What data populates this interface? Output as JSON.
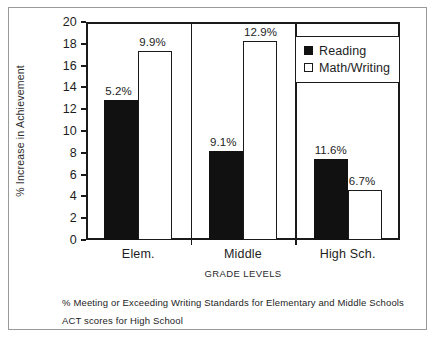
{
  "chart_data": {
    "type": "bar",
    "title": "",
    "xlabel": "GRADE LEVELS",
    "ylabel": "% Increase in Achievement",
    "categories": [
      "Elem.",
      "Middle",
      "High Sch."
    ],
    "ylim": [
      0,
      20
    ],
    "ytick_step": 2,
    "yticks": [
      20,
      18,
      16,
      14,
      12,
      10,
      8,
      6,
      4,
      2,
      0
    ],
    "grid": false,
    "legend_position": "top-right",
    "series": [
      {
        "name": "Reading",
        "style": "filled",
        "color": "#111111",
        "values": [
          12.8,
          8.2,
          7.4
        ],
        "labels": [
          "5.2%",
          "9.1%",
          "11.6%"
        ]
      },
      {
        "name": "Math/Writing",
        "style": "hollow",
        "color": "#ffffff",
        "values": [
          17.3,
          18.3,
          4.6
        ],
        "labels": [
          "9.9%",
          "12.9%",
          "6.7%"
        ]
      }
    ],
    "annotations": [
      "% Meeting or Exceeding Writing Standards for Elementary and Middle Schools",
      "ACT scores for High School"
    ]
  },
  "legend": {
    "items": [
      {
        "label": "Reading"
      },
      {
        "label": "Math/Writing"
      }
    ]
  },
  "footnotes": {
    "line1": "% Meeting or Exceeding Writing Standards for Elementary and Middle Schools",
    "line2": "ACT scores for High School"
  }
}
